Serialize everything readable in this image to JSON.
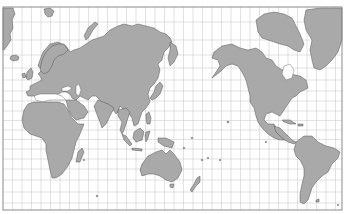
{
  "map": {
    "projection": "Mercator (Pacific-centered)",
    "central_meridian_deg": 150,
    "graticule_step_deg": 10,
    "colors": {
      "land": "#a9a9a9",
      "coast": "#555555",
      "water": "#ffffff",
      "graticule": "#cfcfcf",
      "frame": "#8a8a8a"
    },
    "regions": [
      {
        "name": "Europe",
        "id": "europe"
      },
      {
        "name": "Asia",
        "id": "asia"
      },
      {
        "name": "Africa",
        "id": "africa"
      },
      {
        "name": "Australia",
        "id": "australia"
      },
      {
        "name": "North America",
        "id": "north-america"
      },
      {
        "name": "South America",
        "id": "south-america"
      },
      {
        "name": "Greenland",
        "id": "greenland"
      },
      {
        "name": "Antarctic margin / islands",
        "id": "islands"
      }
    ]
  }
}
